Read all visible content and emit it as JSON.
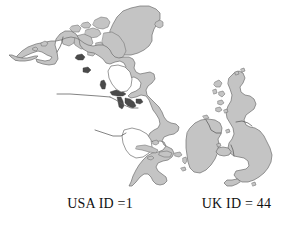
{
  "figure": {
    "background_color": "#ffffff",
    "width": 289,
    "height": 229,
    "land_fill_color": "#c4c4c4",
    "land_outline_color": "#6e6e6e",
    "water_marking_color": "#4a4a4a",
    "text_color": "#111111"
  },
  "captions": {
    "usa": "USA ID =1",
    "uk": "UK ID = 44"
  },
  "regions": {
    "north_america": {
      "label": "north-america-landmass",
      "id_code": "1"
    },
    "greenland": {
      "label": "greenland-landmass"
    },
    "great_britain": {
      "label": "great-britain-landmass",
      "id_code": "44"
    },
    "ireland": {
      "label": "ireland-landmass"
    }
  }
}
